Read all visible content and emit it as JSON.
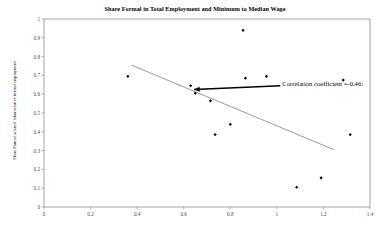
{
  "chart_data": {
    "type": "scatter",
    "title": "Share Formal in Total Employment and Minimum to Median Wage",
    "xlabel": "",
    "ylabel": "Share Formal salaried labor relative to total employment",
    "xlim": [
      0,
      1.4
    ],
    "ylim": [
      0,
      1
    ],
    "xticks": [
      "0",
      "0.2",
      "0.4",
      "0.6",
      "0.8",
      "1",
      "1.2",
      "1.4"
    ],
    "xtick_values": [
      0,
      0.2,
      0.4,
      0.6,
      0.8,
      1,
      1.2,
      1.4
    ],
    "yticks": [
      "0",
      "0.1",
      "0.2",
      "0.3",
      "0.4",
      "0.5",
      "0.6",
      "0.7",
      "0.8",
      "0.9",
      "1"
    ],
    "ytick_values": [
      0,
      0.1,
      0.2,
      0.3,
      0.4,
      0.5,
      0.6,
      0.7,
      0.8,
      0.9,
      1
    ],
    "grid": false,
    "legend": false,
    "marker": "diamond",
    "marker_color": "#000000",
    "points": [
      {
        "x": 0.36,
        "y": 0.695
      },
      {
        "x": 0.63,
        "y": 0.645
      },
      {
        "x": 0.65,
        "y": 0.605
      },
      {
        "x": 0.715,
        "y": 0.565
      },
      {
        "x": 0.735,
        "y": 0.385
      },
      {
        "x": 0.8,
        "y": 0.44
      },
      {
        "x": 0.855,
        "y": 0.94
      },
      {
        "x": 0.865,
        "y": 0.685
      },
      {
        "x": 0.955,
        "y": 0.695
      },
      {
        "x": 1.085,
        "y": 0.105
      },
      {
        "x": 1.19,
        "y": 0.155
      },
      {
        "x": 1.285,
        "y": 0.675
      },
      {
        "x": 1.315,
        "y": 0.385
      }
    ],
    "trendline": {
      "x0": 0.375,
      "y0": 0.755,
      "x1": 1.245,
      "y1": 0.305,
      "color": "#808080"
    },
    "annotations": [
      {
        "text": "Correlation coefficient =-0.46:",
        "arrow_from_x": 1.015,
        "arrow_from_y": 0.645,
        "arrow_to_x": 0.645,
        "arrow_to_y": 0.625,
        "color": "#000000"
      }
    ],
    "axis_color": "#808080",
    "plot_background": "#ffffff"
  }
}
